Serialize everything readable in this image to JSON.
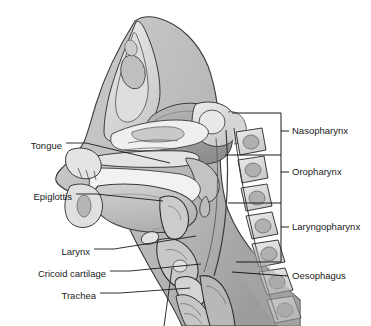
{
  "figure": {
    "width": 371,
    "height": 326,
    "background": "#ffffff",
    "line_color": "#1a1a1a",
    "text_color": "#1a1a1a"
  },
  "palette": {
    "outline": "#2b2b2b",
    "bone_light": "#e6e6e6",
    "bone_mid": "#cfcfcf",
    "soft_tissue": "#b9b9b9",
    "cavity_light": "#efefef",
    "brain_gray": "#a8a8a8",
    "tongue_gray": "#c4c4c4",
    "shadow": "#8f8f8f",
    "leader": "#1a1a1a"
  },
  "labels": {
    "left": [
      {
        "id": "tongue",
        "text": "Tongue",
        "text_x": 62,
        "text_y": 146,
        "dash_x1": 66,
        "dash_x2": 86,
        "leader_x2": 170,
        "leader_y2": 163
      },
      {
        "id": "epiglottis",
        "text": "Epiglottis",
        "text_x": 72,
        "text_y": 197,
        "dash_x1": 76,
        "dash_x2": 96,
        "leader_x2": 163,
        "leader_y2": 201
      },
      {
        "id": "larynx",
        "text": "Larynx",
        "text_x": 90,
        "text_y": 252,
        "dash_x1": 94,
        "dash_x2": 114,
        "leader_x2": 196,
        "leader_y2": 236
      },
      {
        "id": "cricoid-cartilage",
        "text": "Cricoid cartilage",
        "text_x": 106,
        "text_y": 274,
        "dash_x1": 110,
        "dash_x2": 130,
        "leader_x2": 201,
        "leader_y2": 264
      },
      {
        "id": "trachea",
        "text": "Trachea",
        "text_x": 96,
        "text_y": 296,
        "dash_x1": 100,
        "dash_x2": 120,
        "leader_x2": 190,
        "leader_y2": 288
      }
    ],
    "right": [
      {
        "id": "nasopharynx",
        "text": "Nasopharynx",
        "text_x": 292,
        "text_y": 134
      },
      {
        "id": "oropharynx",
        "text": "Oropharynx",
        "text_x": 292,
        "text_y": 175
      },
      {
        "id": "laryngopharynx",
        "text": "Laryngopharynx",
        "text_x": 292,
        "text_y": 230
      },
      {
        "id": "oesophagus",
        "text": "Oesophagus",
        "text_x": 292,
        "text_y": 279
      }
    ]
  },
  "brackets": {
    "left_edge": 232,
    "right_edge": 281,
    "tick_end": 289,
    "segments": [
      {
        "id": "nasopharynx-bracket",
        "top": 113,
        "bottom": 155,
        "tick_y": 134
      },
      {
        "id": "oropharynx-bracket",
        "top": 155,
        "bottom": 203,
        "tick_y": 175
      },
      {
        "id": "laryngopharynx-bracket",
        "top": 203,
        "bottom": 262,
        "tick_y": 230
      }
    ]
  },
  "oesophagus_leader": {
    "x1": 232,
    "y1": 272,
    "x2": 288,
    "y2": 279
  }
}
